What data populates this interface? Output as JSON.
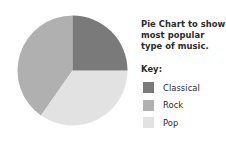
{
  "chart_data": {
    "type": "pie",
    "title": "Pie Chart to show most popular type of music.",
    "legend_title": "Key:",
    "legend_position": "right",
    "categories": [
      "Classical",
      "Rock",
      "Pop"
    ],
    "values": [
      25,
      40,
      35
    ],
    "value_unit": "percent",
    "colors": {
      "classical": "#7a7a7a",
      "rock": "#b0b0b0",
      "pop": "#e2e2e2"
    },
    "slices": [
      {
        "label": "Classical",
        "value": 25,
        "color": "#7a7a7a",
        "start_angle": 0,
        "end_angle": 90
      },
      {
        "label": "Pop",
        "value": 35,
        "color": "#e2e2e2",
        "start_angle": 90,
        "end_angle": 215
      },
      {
        "label": "Rock",
        "value": 40,
        "color": "#b0b0b0",
        "start_angle": 215,
        "end_angle": 360
      }
    ],
    "geometry": {
      "cx": 55.5,
      "cy": 55.5,
      "r": 55
    }
  },
  "legend": {
    "title": "Key:",
    "items": [
      {
        "label": "Classical",
        "color": "#7a7a7a"
      },
      {
        "label": "Rock",
        "color": "#b0b0b0"
      },
      {
        "label": "Pop",
        "color": "#e2e2e2"
      }
    ]
  },
  "title": {
    "text": "Pie Chart to show most popular type of music."
  }
}
